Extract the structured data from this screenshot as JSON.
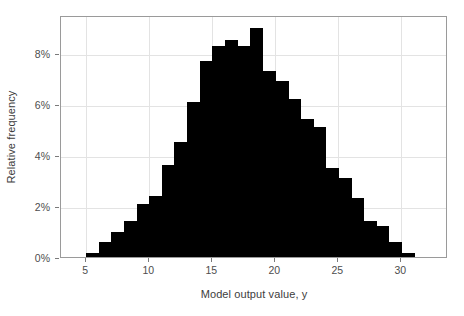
{
  "chart_data": {
    "type": "bar",
    "title": "",
    "subtitle": "",
    "xlabel": "Model output value, y",
    "ylabel": "Relative frequency",
    "xlim": [
      3.0,
      33.7
    ],
    "ylim": [
      0,
      9.5
    ],
    "xticks": [
      5,
      10,
      15,
      20,
      25,
      30
    ],
    "xtick_labels": [
      "5",
      "10",
      "15",
      "20",
      "25",
      "30"
    ],
    "yticks": [
      0,
      2,
      4,
      6,
      8
    ],
    "ytick_labels": [
      "0%",
      "2%",
      "4%",
      "6%",
      "8%"
    ],
    "grid": true,
    "legend": null,
    "bin_width": 1,
    "bar_color": "#000000",
    "panel_border_color": "#9a9a9a",
    "grid_color": "#e3e3e3",
    "bin_starts": [
      5,
      6,
      7,
      8,
      9,
      10,
      11,
      12,
      13,
      14,
      15,
      16,
      17,
      18,
      19,
      20,
      21,
      22,
      23,
      24,
      25,
      26,
      27,
      28,
      29,
      30
    ],
    "categories": [
      "5-6",
      "6-7",
      "7-8",
      "8-9",
      "9-10",
      "10-11",
      "11-12",
      "12-13",
      "13-14",
      "14-15",
      "15-16",
      "16-17",
      "17-18",
      "18-19",
      "19-20",
      "20-21",
      "21-22",
      "22-23",
      "23-24",
      "24-25",
      "25-26",
      "26-27",
      "27-28",
      "28-29",
      "29-30",
      "30-31"
    ],
    "values": [
      0.15,
      0.6,
      1.0,
      1.4,
      2.1,
      2.4,
      3.6,
      4.5,
      6.1,
      7.7,
      8.3,
      8.5,
      8.3,
      9.0,
      7.3,
      6.9,
      6.2,
      5.4,
      5.1,
      3.5,
      3.1,
      2.3,
      1.4,
      1.2,
      0.6,
      0.15
    ]
  }
}
